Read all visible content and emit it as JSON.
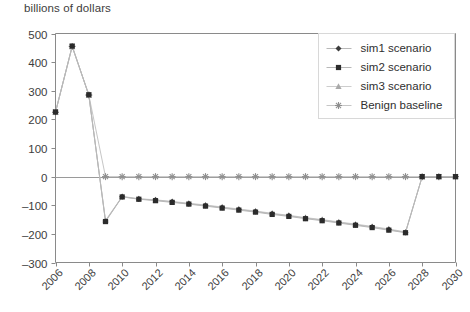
{
  "chart_data": {
    "type": "line",
    "title": "billions of dollars",
    "xlabel": "",
    "ylabel": "billions of dollars",
    "ylim": [
      -300,
      500
    ],
    "xlim": [
      2006,
      2030
    ],
    "yticks": [
      -300,
      -200,
      -100,
      0,
      100,
      200,
      300,
      400,
      500
    ],
    "xticks": [
      2006,
      2008,
      2010,
      2012,
      2014,
      2016,
      2018,
      2020,
      2022,
      2024,
      2026,
      2028,
      2030
    ],
    "xtick_labels": [
      "2006",
      "2008",
      "2010",
      "2012",
      "2014",
      "2016",
      "2018",
      "2020",
      "2022",
      "2024",
      "2026",
      "2028",
      "2030"
    ],
    "xtick_rotation": 45,
    "grid": false,
    "legend_position": "upper right",
    "x": [
      2006,
      2007,
      2008,
      2009,
      2010,
      2011,
      2012,
      2013,
      2014,
      2015,
      2016,
      2017,
      2018,
      2019,
      2020,
      2021,
      2022,
      2023,
      2024,
      2025,
      2026,
      2027,
      2028,
      2029,
      2030
    ],
    "series": [
      {
        "name": "sim1 scenario",
        "marker": "diamond",
        "color": "#3c3c3c",
        "line_color": "#b8b8b8",
        "values": [
          225,
          455,
          285,
          -155,
          -70,
          -78,
          -82,
          -88,
          -95,
          -101,
          -108,
          -115,
          -122,
          -130,
          -137,
          -145,
          -152,
          -160,
          -168,
          -176,
          -185,
          -195,
          0,
          0,
          0
        ]
      },
      {
        "name": "sim2 scenario",
        "marker": "square",
        "color": "#2b2b2b",
        "line_color": "#b8b8b8",
        "values": [
          226,
          456,
          286,
          -157,
          -71,
          -79,
          -84,
          -90,
          -96,
          -103,
          -110,
          -117,
          -124,
          -132,
          -139,
          -147,
          -154,
          -162,
          -170,
          -178,
          -187,
          -196,
          0,
          0,
          0
        ]
      },
      {
        "name": "sim3 scenario",
        "marker": "triangle",
        "color": "#a9a9a9",
        "line_color": "#cdcdcd",
        "values": [
          224,
          454,
          284,
          -153,
          -69,
          -77,
          -81,
          -87,
          -93,
          -99,
          -106,
          -113,
          -120,
          -128,
          -135,
          -143,
          -150,
          -158,
          -166,
          -174,
          -183,
          -193,
          0,
          0,
          0
        ]
      },
      {
        "name": "Benign baseline",
        "marker": "asterisk",
        "color": "#8f8f8f",
        "line_color": "#c6c6c6",
        "values": [
          225,
          455,
          285,
          0,
          0,
          0,
          0,
          0,
          0,
          0,
          0,
          0,
          0,
          0,
          0,
          0,
          0,
          0,
          0,
          0,
          0,
          0,
          0,
          0,
          0
        ]
      }
    ]
  },
  "legend": {
    "items": [
      {
        "label": "sim1 scenario"
      },
      {
        "label": "sim2 scenario"
      },
      {
        "label": "sim3 scenario"
      },
      {
        "label": "Benign baseline"
      }
    ]
  },
  "colors": {
    "axis": "#8a8a8a",
    "zero_line": "#9a9a9a",
    "legend_border": "#d8d8d8",
    "text": "#3d3d3d"
  }
}
